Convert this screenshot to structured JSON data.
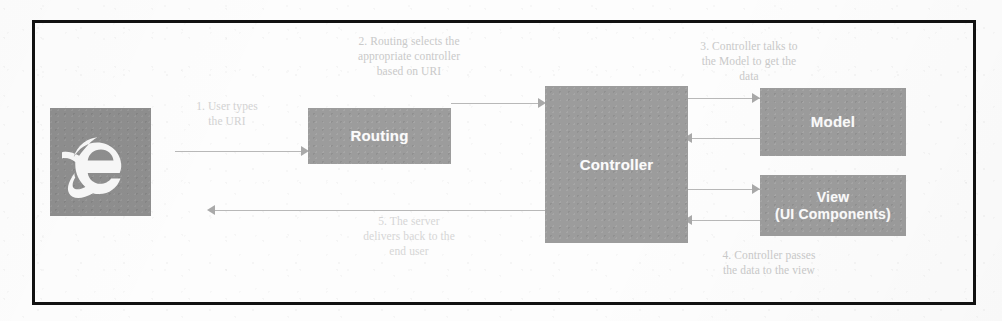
{
  "diagram": {
    "frame_color": "#111111",
    "box_color": "#9c9c9c",
    "box_text_color": "#fbfbfb",
    "annotation_color": "#c9c9c9",
    "connector_color": "#b8b8b8",
    "background_color": "#fdfdfd"
  },
  "nodes": {
    "browser": {
      "label": "",
      "icon": "internet-explorer-icon"
    },
    "routing": {
      "label": "Routing"
    },
    "controller": {
      "label": "Controller"
    },
    "model": {
      "label": "Model"
    },
    "view": {
      "line1": "View",
      "line2": "(UI Components)"
    }
  },
  "annotations": [
    {
      "id": "step-1",
      "text": "1. User types\nthe URI"
    },
    {
      "id": "step-2",
      "text": "2. Routing selects the\nappropriate controller\nbased on URI"
    },
    {
      "id": "step-3",
      "text": "3. Controller talks to\nthe Model to get the\ndata"
    },
    {
      "id": "step-4",
      "text": "4. Controller passes\nthe data to the view"
    },
    {
      "id": "step-5",
      "text": "5. The server\ndelivers back to the\nend user"
    }
  ],
  "connectors": [
    {
      "id": "browser-to-routing",
      "direction": "right"
    },
    {
      "id": "routing-to-controller",
      "direction": "right"
    },
    {
      "id": "controller-to-model",
      "direction": "right"
    },
    {
      "id": "model-to-controller",
      "direction": "left"
    },
    {
      "id": "controller-to-view",
      "direction": "right"
    },
    {
      "id": "view-to-controller",
      "direction": "left"
    },
    {
      "id": "controller-to-browser-return",
      "direction": "left"
    }
  ]
}
